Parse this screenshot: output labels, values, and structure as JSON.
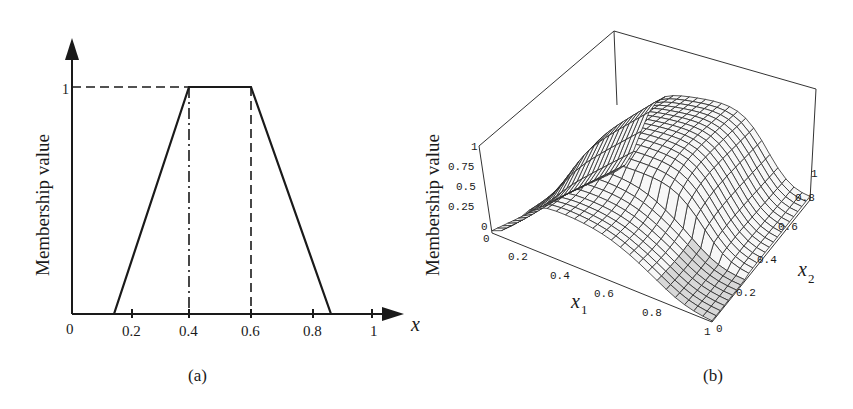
{
  "chart_data": [
    {
      "id": "a",
      "type": "line",
      "title": "",
      "caption": "(a)",
      "xlabel": "x",
      "xlabel_sub": "1",
      "ylabel": "Membership value",
      "xlim": [
        0,
        1
      ],
      "ylim": [
        0,
        1
      ],
      "x_ticks": [
        "0",
        "0.2",
        "0.4",
        "0.6",
        "0.8",
        "1"
      ],
      "y_ticks": [
        "1"
      ],
      "grid": false,
      "series": [
        {
          "name": "trapezoidal membership function",
          "x": [
            0,
            0.14,
            0.4,
            0.6,
            0.86,
            1
          ],
          "y": [
            0,
            0,
            1,
            1,
            0,
            0
          ]
        }
      ],
      "annotations": [
        {
          "kind": "dashed horizontal",
          "from_x": 0,
          "to_x": 0.4,
          "y": 1
        },
        {
          "kind": "dash-dot vertical",
          "x": 0.4,
          "from_y": 0,
          "to_y": 1
        },
        {
          "kind": "dashed vertical",
          "x": 0.6,
          "from_y": 0,
          "to_y": 1
        }
      ]
    },
    {
      "id": "b",
      "type": "surface",
      "title": "",
      "caption": "(b)",
      "xlabel": "x",
      "xlabel_sub": "1",
      "ylabel_axis": "x",
      "ylabel_axis_sub": "2",
      "zlabel": "Membership value",
      "xlim": [
        0,
        1
      ],
      "ylim": [
        0,
        1
      ],
      "zlim": [
        0,
        1
      ],
      "x_ticks": [
        "0",
        "0.2",
        "0.4",
        "0.6",
        "0.8",
        "1"
      ],
      "y_ticks": [
        "0",
        "0.2",
        "0.4",
        "0.6",
        "0.8",
        "1"
      ],
      "z_ticks": [
        "0",
        "0.25",
        "0.5",
        "0.75",
        "1"
      ],
      "grid": "wireframe mesh",
      "description": "Two-dimensional membership surface: ridge of value ~1 running along x2 direction for mid x1, falling to ~0 toward x1=1 and low x2"
    }
  ],
  "panel_a": {
    "ylabel": "Membership value",
    "ytick_one": "1",
    "xticks": [
      "0",
      "0.2",
      "0.4",
      "0.6",
      "0.8",
      "1"
    ],
    "xlabel": "x",
    "xlabel_sub": "1",
    "caption": "(a)"
  },
  "panel_b": {
    "zlabel": "Membership value",
    "zticks": [
      "1",
      "0.75",
      "0.5",
      "0.25",
      "0"
    ],
    "x1ticks": [
      "0",
      "0.2",
      "0.4",
      "0.6",
      "0.8",
      "1"
    ],
    "x2ticks": [
      "0",
      "0.2",
      "0.4",
      "0.6",
      "0.8",
      "1"
    ],
    "x1label": "x",
    "x1label_sub": "1",
    "x2label": "x",
    "x2label_sub": "2",
    "caption": "(b)"
  }
}
